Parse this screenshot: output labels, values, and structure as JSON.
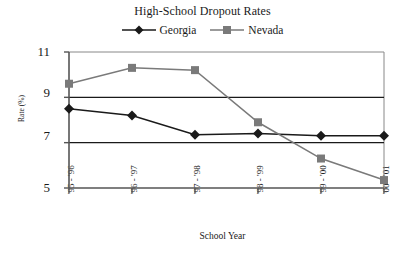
{
  "chart_data": {
    "type": "line",
    "title": "High-School Dropout Rates",
    "xlabel": "School Year",
    "ylabel": "Rate (%)",
    "categories": [
      "'95 - '96",
      "'96 - '97",
      "'97 - '98",
      "'98 - '99",
      "'99 - '00",
      "'00 - '01"
    ],
    "series": [
      {
        "name": "Georgia",
        "marker": "diamond",
        "color": "#1a1a1a",
        "values": [
          8.5,
          8.2,
          7.35,
          7.4,
          7.3,
          7.3
        ]
      },
      {
        "name": "Nevada",
        "marker": "square",
        "color": "#7a7a7a",
        "values": [
          9.6,
          10.3,
          10.2,
          7.9,
          6.3,
          5.35
        ]
      }
    ],
    "ylim": [
      5,
      11
    ],
    "yticks": [
      5,
      7,
      9,
      11
    ],
    "ytick_labels": [
      "5",
      "7",
      "9",
      "11"
    ],
    "grid": "horizontal",
    "legend_position": "top-center"
  },
  "colors": {
    "georgia": "#1a1a1a",
    "nevada": "#7a7a7a",
    "axis": "#555555",
    "gridline": "#1a1a1a",
    "plot_border": "#888888",
    "background": "#ffffff"
  }
}
